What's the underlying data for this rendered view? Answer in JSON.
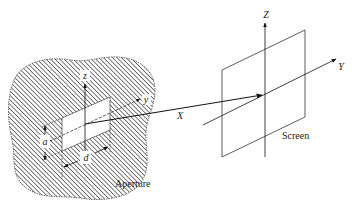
{
  "figure": {
    "aperture": {
      "label": "Aperture",
      "axis_labels": {
        "z": "z",
        "y": "y"
      },
      "dimension_labels": {
        "height": "a",
        "width": "d"
      }
    },
    "screen": {
      "label": "Screen",
      "axis_labels": {
        "Z": "Z",
        "Y": "Y",
        "X": "X"
      }
    },
    "colors": {
      "ink": "#222222",
      "hatch": "#333333",
      "background": "#ffffff"
    }
  }
}
